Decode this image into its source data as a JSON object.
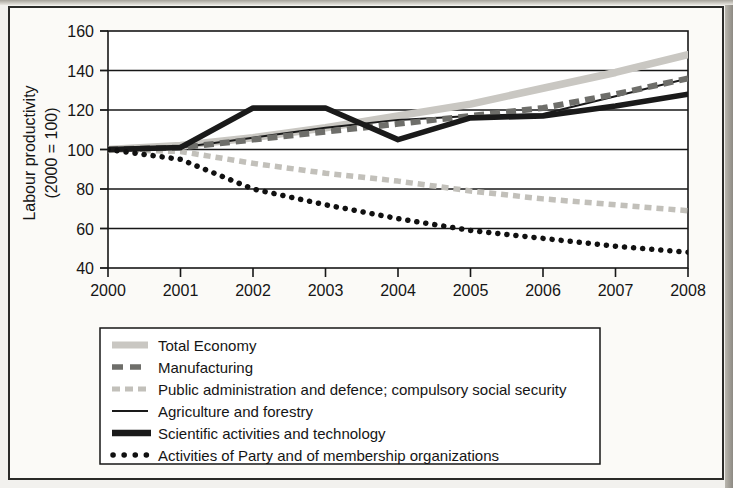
{
  "chart_data": {
    "type": "line",
    "title": "",
    "subtitle": "",
    "xlabel": "",
    "ylabel": "Labour productivity\n(2000 = 100)",
    "ylabel_line1": "Labour productivity",
    "ylabel_line2": "(2000 = 100)",
    "x": [
      2000,
      2001,
      2002,
      2003,
      2004,
      2005,
      2006,
      2007,
      2008
    ],
    "categories": [
      "2000",
      "2001",
      "2002",
      "2003",
      "2004",
      "2005",
      "2006",
      "2007",
      "2008"
    ],
    "xlim": [
      2000,
      2008
    ],
    "ylim": [
      40,
      160
    ],
    "yticks": [
      40,
      60,
      80,
      100,
      120,
      140,
      160
    ],
    "ytick_labels": [
      "40",
      "60",
      "80",
      "100",
      "120",
      "140",
      "160"
    ],
    "xticks": [
      2000,
      2001,
      2002,
      2003,
      2004,
      2005,
      2006,
      2007,
      2008
    ],
    "grid": "horizontal",
    "legend_position": "below-plot",
    "series": [
      {
        "name": "Total Economy",
        "style": "thick-solid-lightgray",
        "color": "#c9c7c2",
        "values": [
          100,
          102,
          106,
          111,
          117,
          123,
          131,
          139,
          148
        ]
      },
      {
        "name": "Manufacturing",
        "style": "dashed-darkgray",
        "color": "#6e6e6a",
        "values": [
          100,
          101,
          105,
          109,
          113,
          117,
          121,
          128,
          136
        ]
      },
      {
        "name": "Public administration and defence; compulsory social security",
        "style": "dashed-lightgray",
        "color": "#c2c0ba",
        "values": [
          100,
          99,
          93,
          88,
          84,
          79,
          75,
          72,
          69
        ]
      },
      {
        "name": "Agriculture and forestry",
        "style": "thin-solid-black",
        "color": "#1a1a1a",
        "values": [
          100,
          101,
          106,
          111,
          115,
          117,
          118,
          127,
          136
        ]
      },
      {
        "name": "Scientific activities and technology",
        "style": "thick-solid-black",
        "color": "#1a1a1a",
        "values": [
          100,
          101,
          121,
          121,
          105,
          116,
          117,
          122,
          128
        ]
      },
      {
        "name": "Activities of Party and of membership organizations",
        "style": "dotted-black",
        "color": "#111111",
        "values": [
          100,
          95,
          80,
          72,
          65,
          59,
          55,
          51,
          48
        ]
      }
    ],
    "legend_entries": [
      {
        "label": "Total Economy",
        "swatch": "thick-solid-lightgray",
        "color": "#c9c7c2"
      },
      {
        "label": "Manufacturing",
        "swatch": "dashed-darkgray",
        "color": "#6e6e6a"
      },
      {
        "label": "Public administration and defence; compulsory social security",
        "swatch": "dashed-lightgray",
        "color": "#c2c0ba"
      },
      {
        "label": "Agriculture and forestry",
        "swatch": "thin-solid-black",
        "color": "#1a1a1a"
      },
      {
        "label": "Scientific activities and technology",
        "swatch": "thick-solid-black",
        "color": "#1a1a1a"
      },
      {
        "label": "Activities of Party and of membership organizations",
        "swatch": "dotted-black",
        "color": "#111111"
      }
    ]
  },
  "axes": {
    "y_title_line1": "Labour productivity",
    "y_title_line2": "(2000 = 100)",
    "y_tick_160": "160",
    "y_tick_140": "140",
    "y_tick_120": "120",
    "y_tick_100": "100",
    "y_tick_80": "80",
    "y_tick_60": "60",
    "y_tick_40": "40",
    "x_tick_2000": "2000",
    "x_tick_2001": "2001",
    "x_tick_2002": "2002",
    "x_tick_2003": "2003",
    "x_tick_2004": "2004",
    "x_tick_2005": "2005",
    "x_tick_2006": "2006",
    "x_tick_2007": "2007",
    "x_tick_2008": "2008"
  },
  "legend": {
    "item_0": "Total Economy",
    "item_1": "Manufacturing",
    "item_2": "Public administration and defence; compulsory social security",
    "item_3": "Agriculture and forestry",
    "item_4": "Scientific activities and technology",
    "item_5": "Activities of Party and of membership organizations"
  }
}
